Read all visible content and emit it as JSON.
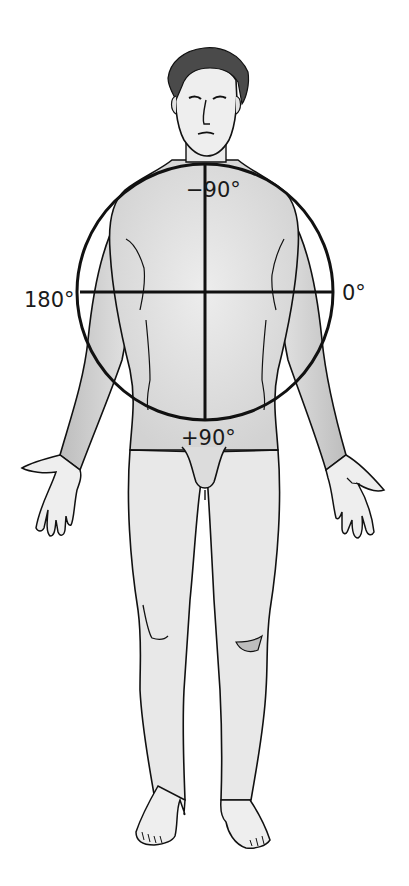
{
  "diagram": {
    "type": "angle-orientation-on-body",
    "circle": {
      "center": [
        205,
        292
      ],
      "radius": 128
    },
    "axes": {
      "horizontal": {
        "from": [
          80,
          292
        ],
        "to": [
          333,
          292
        ]
      },
      "vertical": {
        "from": [
          205,
          163
        ],
        "to": [
          205,
          421
        ]
      }
    },
    "labels": {
      "top": "−90°",
      "right": "0°",
      "left": "180°",
      "bottom": "+90°"
    },
    "colors": {
      "line": "#111111",
      "skin": "#e9e9e9",
      "shade": "#c9c9c9",
      "hair": "#4a4a4a",
      "background": "#ffffff"
    }
  }
}
